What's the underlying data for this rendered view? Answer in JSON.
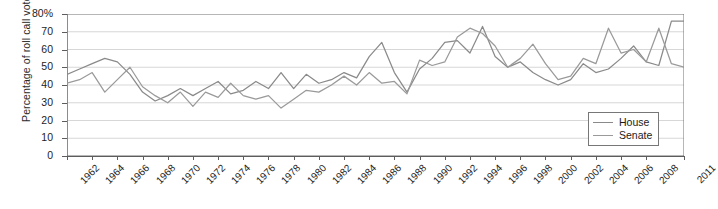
{
  "chart_data": {
    "type": "line",
    "title": "",
    "xlabel": "",
    "ylabel": "Percentage of roll call votes",
    "ylim": [
      0,
      80
    ],
    "ytick_labels": [
      "80%",
      "70",
      "60",
      "50",
      "40",
      "30",
      "20",
      "10",
      "0"
    ],
    "ytick_values": [
      80,
      70,
      60,
      50,
      40,
      30,
      20,
      10,
      0
    ],
    "grid": true,
    "legend_position": "bottom-right",
    "xtick_labels": [
      "1962",
      "1964",
      "1966",
      "1968",
      "1970",
      "1972",
      "1974",
      "1976",
      "1978",
      "1980",
      "1982",
      "1984",
      "1986",
      "1988",
      "1990",
      "1992",
      "1994",
      "1996",
      "1998",
      "2000",
      "2002",
      "2004",
      "2006",
      "2008",
      "2011"
    ],
    "x": [
      1962,
      1963,
      1964,
      1965,
      1966,
      1967,
      1968,
      1969,
      1970,
      1971,
      1972,
      1973,
      1974,
      1975,
      1976,
      1977,
      1978,
      1979,
      1980,
      1981,
      1982,
      1983,
      1984,
      1985,
      1986,
      1987,
      1988,
      1989,
      1990,
      1991,
      1992,
      1993,
      1994,
      1995,
      1996,
      1997,
      1998,
      1999,
      2000,
      2001,
      2002,
      2003,
      2004,
      2005,
      2006,
      2007,
      2008,
      2009,
      2010,
      2011
    ],
    "series": [
      {
        "name": "House",
        "color": "#8a8a8a",
        "values": [
          46,
          49,
          52,
          55,
          53,
          46,
          36,
          31,
          34,
          38,
          34,
          38,
          42,
          35,
          37,
          42,
          38,
          47,
          38,
          46,
          41,
          43,
          47,
          44,
          56,
          64,
          47,
          36,
          49,
          55,
          64,
          65,
          58,
          73,
          56,
          50,
          53,
          47,
          43,
          40,
          43,
          52,
          47,
          49,
          55,
          62,
          53,
          51,
          76,
          76
        ]
      },
      {
        "name": "Senate",
        "color": "#9a9a9a",
        "values": [
          41,
          43,
          47,
          36,
          43,
          50,
          39,
          34,
          30,
          36,
          28,
          36,
          33,
          41,
          34,
          32,
          34,
          27,
          32,
          37,
          36,
          40,
          45,
          40,
          47,
          41,
          42,
          35,
          54,
          51,
          53,
          67,
          72,
          69,
          62,
          50,
          55,
          63,
          52,
          43,
          45,
          55,
          52,
          72,
          58,
          60,
          53,
          72,
          52,
          50
        ]
      }
    ]
  },
  "legend": {
    "items": [
      {
        "label": "House"
      },
      {
        "label": "Senate"
      }
    ]
  }
}
